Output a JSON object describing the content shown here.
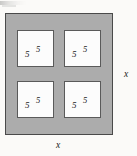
{
  "figure": {
    "outer_square": {
      "fill_color": "#acacac",
      "border_color": "#4a4a4a",
      "right_dimension_label": "x",
      "bottom_dimension_label": "x"
    },
    "inner_squares": [
      {
        "position": "top-left",
        "fill_color": "#fcfcfc",
        "border_color": "#5a5a5a",
        "label_a": "5",
        "label_b": "5"
      },
      {
        "position": "top-right",
        "fill_color": "#fcfcfc",
        "border_color": "#5a5a5a",
        "label_a": "5",
        "label_b": "5"
      },
      {
        "position": "bottom-left",
        "fill_color": "#fcfcfc",
        "border_color": "#5a5a5a",
        "label_a": "5",
        "label_b": "5"
      },
      {
        "position": "bottom-right",
        "fill_color": "#fcfcfc",
        "border_color": "#5a5a5a",
        "label_a": "5",
        "label_b": "5"
      }
    ]
  }
}
